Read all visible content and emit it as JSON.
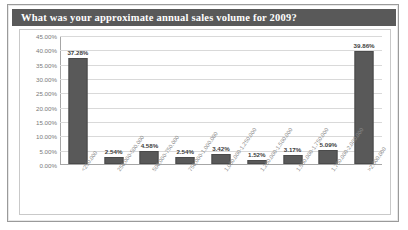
{
  "header": {
    "title": "What was your approximate annual sales volume for 2009?",
    "title_bar_color": "#595959"
  },
  "colors": {
    "bar_fill": "#595959",
    "gridline": "#d9d9d9",
    "axis": "#a6a6a6",
    "plot_background": "#ffffff",
    "frame_border": "#9a9a9a",
    "value_label": "#404040",
    "tick_label": "#7a7a7a"
  },
  "chart_data": {
    "type": "bar",
    "title": "What was your approximate annual sales volume for 2009?",
    "xlabel": "",
    "ylabel": "",
    "ylim": [
      0,
      45
    ],
    "ytick_labels": [
      "45.00%",
      "40.00%",
      "35.00%",
      "30.00%",
      "25.00%",
      "20.00%",
      "15.00%",
      "10.00%",
      "5.00%",
      "0.00%"
    ],
    "ytick_values": [
      45,
      40,
      35,
      30,
      25,
      20,
      15,
      10,
      5,
      0
    ],
    "grid": true,
    "legend": false,
    "categories": [
      "<250,000",
      "250,000-500,000",
      "500,000-750,000",
      "750,000-1,000,000",
      "1,000,000-1,250,000",
      "1,250,000-1,500,000",
      "1,500,000-1,750,000",
      "1,750,000-2,000,000",
      ">2,000,000"
    ],
    "values": [
      37.28,
      2.54,
      4.58,
      2.54,
      3.42,
      1.52,
      3.17,
      5.09,
      39.86
    ],
    "value_labels": [
      "37.28%",
      "2.54%",
      "4.58%",
      "2.54%",
      "3.42%",
      "1.52%",
      "3.17%",
      "5.09%",
      "39.86%"
    ]
  }
}
